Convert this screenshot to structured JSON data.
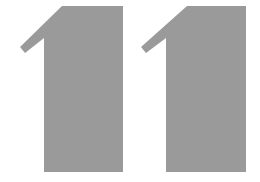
{
  "text": "11",
  "digits": [
    {
      "char": "1",
      "color": "#9a9a9a"
    },
    {
      "char": "1",
      "color": "#9a9a9a"
    }
  ],
  "background": "#ffffff"
}
